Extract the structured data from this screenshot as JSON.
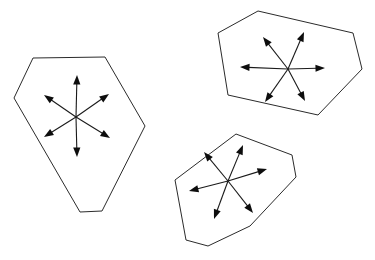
{
  "canvas": {
    "width": 375,
    "height": 260,
    "background_color": "#ffffff",
    "stroke_color": "#2b2b2b",
    "arrow_color": "#0d0d0d"
  },
  "diagram": {
    "shape_count": 3,
    "arrows_per_shape": 6
  },
  "shapes": [
    {
      "id": "shape-left",
      "name": "left-polygon",
      "sides": 6,
      "outline_points": "33,58 105,57 145,126 102,211 80,212 14,98",
      "center": {
        "x": 76,
        "y": 117
      },
      "arrows": [
        {
          "name": "arrow-up",
          "tip": {
            "x": 77,
            "y": 75
          }
        },
        {
          "name": "arrow-down",
          "tip": {
            "x": 77,
            "y": 157
          }
        },
        {
          "name": "arrow-upper-left",
          "tip": {
            "x": 44,
            "y": 95
          }
        },
        {
          "name": "arrow-upper-right",
          "tip": {
            "x": 109,
            "y": 94
          }
        },
        {
          "name": "arrow-lower-left",
          "tip": {
            "x": 44,
            "y": 137
          }
        },
        {
          "name": "arrow-lower-right",
          "tip": {
            "x": 110,
            "y": 138
          }
        }
      ]
    },
    {
      "id": "shape-top-right",
      "name": "top-right-polygon",
      "sides": 6,
      "outline_points": "258,11 353,33 362,69 318,115 228,95 218,33",
      "center": {
        "x": 288,
        "y": 69
      },
      "arrows": [
        {
          "name": "arrow-left",
          "tip": {
            "x": 240,
            "y": 67
          }
        },
        {
          "name": "arrow-right",
          "tip": {
            "x": 325,
            "y": 68
          }
        },
        {
          "name": "arrow-upper-left",
          "tip": {
            "x": 263,
            "y": 37
          }
        },
        {
          "name": "arrow-upper-right",
          "tip": {
            "x": 304,
            "y": 32
          }
        },
        {
          "name": "arrow-lower-left",
          "tip": {
            "x": 265,
            "y": 102
          }
        },
        {
          "name": "arrow-lower-right",
          "tip": {
            "x": 305,
            "y": 101
          }
        }
      ]
    },
    {
      "id": "shape-bottom-right",
      "name": "bottom-right-polygon",
      "sides": 7,
      "outline_points": "236,134 292,155 296,177 250,226 208,246 186,240 175,180",
      "center": {
        "x": 228,
        "y": 181
      },
      "arrows": [
        {
          "name": "arrow-left",
          "tip": {
            "x": 189,
            "y": 191
          }
        },
        {
          "name": "arrow-right",
          "tip": {
            "x": 267,
            "y": 169
          }
        },
        {
          "name": "arrow-upper-left",
          "tip": {
            "x": 204,
            "y": 152
          }
        },
        {
          "name": "arrow-upper-right",
          "tip": {
            "x": 243,
            "y": 145
          }
        },
        {
          "name": "arrow-lower-left",
          "tip": {
            "x": 214,
            "y": 219
          }
        },
        {
          "name": "arrow-lower-right",
          "tip": {
            "x": 253,
            "y": 213
          }
        }
      ]
    }
  ]
}
